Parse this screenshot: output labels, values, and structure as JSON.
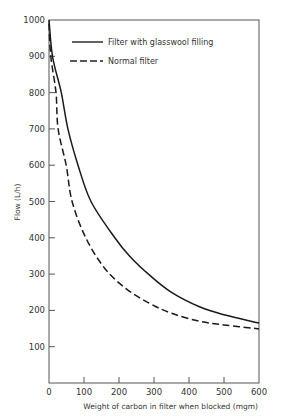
{
  "chart_data": {
    "type": "line",
    "title": "",
    "xlabel": "Weight of carbon in filter when blocked (mgm)",
    "ylabel": "Flow (L/h)",
    "xlim": [
      0,
      600
    ],
    "ylim": [
      0,
      1000
    ],
    "x_ticks": [
      "0",
      "100",
      "200",
      "300",
      "400",
      "500",
      "600"
    ],
    "y_ticks": [
      "100",
      "200",
      "300",
      "400",
      "500",
      "600",
      "700",
      "800",
      "900",
      "1000"
    ],
    "grid": false,
    "legend_position": "upper right inside",
    "series": [
      {
        "name": "Filter with glasswool filling",
        "style": "solid",
        "x": [
          0,
          10,
          35,
          54,
          83,
          120,
          188,
          230,
          290,
          350,
          430,
          500,
          600
        ],
        "y": [
          1000,
          900,
          800,
          700,
          600,
          500,
          400,
          350,
          295,
          250,
          210,
          188,
          165
        ]
      },
      {
        "name": "Normal filter",
        "style": "dashed",
        "x": [
          0,
          5,
          20,
          26,
          49,
          66,
          105,
          160,
          220,
          286,
          350,
          430,
          500,
          600
        ],
        "y": [
          990,
          900,
          800,
          700,
          600,
          500,
          400,
          315,
          260,
          220,
          192,
          170,
          160,
          149
        ]
      }
    ]
  },
  "axis": {
    "x_title": "Weight of carbon in filter when blocked (mgm)",
    "y_title": "Flow (L/h)"
  },
  "legend": {
    "items": [
      {
        "label": "Filter with glasswool filling",
        "style": "solid"
      },
      {
        "label": "Normal filter",
        "style": "dashed"
      }
    ]
  }
}
